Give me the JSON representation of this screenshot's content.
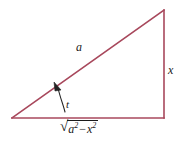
{
  "figure": {
    "type": "right-triangle-diagram",
    "background_color": "#ffffff",
    "line_color": "#a8485c",
    "text_color": "#1a1a1a",
    "annotation_color": "#222222",
    "vertices": {
      "left": [
        12,
        118
      ],
      "top_right": [
        164,
        10
      ],
      "bottom_right": [
        164,
        118
      ]
    },
    "labels": {
      "hypotenuse": "a",
      "opposite": "x",
      "angle": "t",
      "base_radical_sign": "√",
      "base_radicand_a": "a",
      "base_exponent_a": "2",
      "base_operator": "−",
      "base_radicand_x": "x",
      "base_exponent_x": "2",
      "base_full": "√(a² − x²)"
    }
  }
}
